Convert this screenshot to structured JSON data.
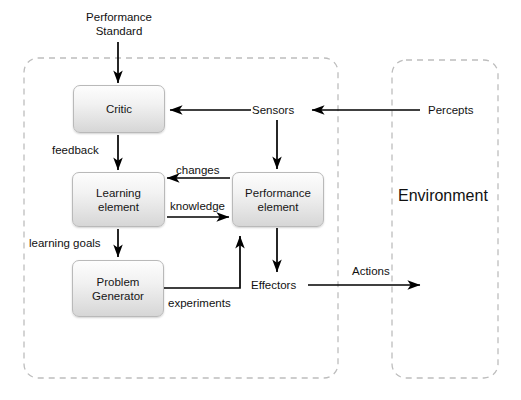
{
  "diagram": {
    "containers": [
      {
        "name": "agent",
        "label": "",
        "x": 24,
        "y": 58,
        "w": 314,
        "h": 320
      },
      {
        "name": "environment",
        "label": "Environment",
        "x": 392,
        "y": 60,
        "w": 106,
        "h": 318
      }
    ],
    "boxes": [
      {
        "id": "critic",
        "line1": "Critic",
        "line2": "",
        "x": 73,
        "y": 85,
        "w": 90,
        "h": 46
      },
      {
        "id": "learning",
        "line1": "Learning",
        "line2": "element",
        "x": 72,
        "y": 172,
        "w": 91,
        "h": 53
      },
      {
        "id": "problemgen",
        "line1": "Problem",
        "line2": "Generator",
        "x": 72,
        "y": 260,
        "w": 90,
        "h": 55
      },
      {
        "id": "performance",
        "line1": "Performance",
        "line2": "element",
        "x": 232,
        "y": 172,
        "w": 90,
        "h": 53
      }
    ],
    "labels": [
      {
        "id": "performance-standard",
        "line1": "Performance",
        "line2": "Standard",
        "x": 78,
        "y": 10
      },
      {
        "id": "sensors",
        "line1": "Sensors",
        "line2": "",
        "x": 252,
        "y": 103
      },
      {
        "id": "percepts",
        "line1": "Percepts",
        "line2": "",
        "x": 428,
        "y": 103
      },
      {
        "id": "feedback",
        "line1": "feedback",
        "line2": "",
        "x": 52,
        "y": 143
      },
      {
        "id": "changes",
        "line1": "changes",
        "line2": "",
        "x": 176,
        "y": 163
      },
      {
        "id": "knowledge",
        "line1": "knowledge",
        "line2": "",
        "x": 170,
        "y": 199
      },
      {
        "id": "learning-goals",
        "line1": "learning goals",
        "line2": "",
        "x": 29,
        "y": 236
      },
      {
        "id": "effectors",
        "line1": "Effectors",
        "line2": "",
        "x": 251,
        "y": 278
      },
      {
        "id": "actions",
        "line1": "Actions",
        "line2": "",
        "x": 352,
        "y": 264
      },
      {
        "id": "experiments",
        "line1": "experiments",
        "line2": "",
        "x": 168,
        "y": 296
      }
    ],
    "colors": {
      "stroke": "#000000",
      "container_stroke": "#bdbdbd",
      "box_border": "#b9b9b9",
      "background": "#ffffff",
      "text": "#111111"
    }
  }
}
